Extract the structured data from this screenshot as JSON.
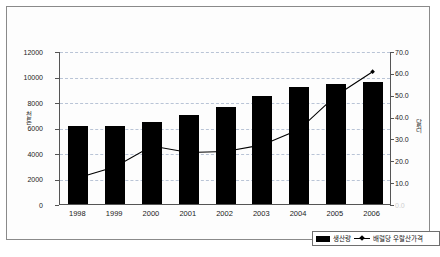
{
  "chart_data": {
    "type": "bar",
    "title": "",
    "subtitle": "",
    "xlabel": "",
    "categories": [
      "1998",
      "1999",
      "2000",
      "2001",
      "2002",
      "2003",
      "2004",
      "2005",
      "2006"
    ],
    "grid": true,
    "legend_position": "bottom-right",
    "series": [
      {
        "name": "생산량",
        "type": "bar",
        "axis": "left",
        "color": "#000000",
        "values": [
          6100,
          6100,
          6450,
          6950,
          7600,
          8450,
          9150,
          9450,
          9550
        ]
      },
      {
        "name": "배럴당 우랄산가격",
        "type": "line",
        "axis": "right",
        "color": "#000000",
        "marker": "diamond",
        "values": [
          12.5,
          17.5,
          27.0,
          24.0,
          24.5,
          27.5,
          34.5,
          50.0,
          61.0
        ]
      }
    ],
    "left_axis": {
      "label": "천톤",
      "min": 0,
      "max": 12000,
      "ticks": [
        0,
        2000,
        4000,
        6000,
        8000,
        10000,
        12000
      ],
      "tick_labels": [
        "0",
        "2000",
        "4000",
        "6000",
        "8000",
        "10000",
        "12000"
      ]
    },
    "right_axis": {
      "label": "달러",
      "min": 0,
      "max": 70,
      "ticks": [
        0,
        10,
        20,
        30,
        40,
        50,
        60,
        70
      ],
      "tick_labels": [
        "0.0",
        "10.0",
        "20.0",
        "30.0",
        "40.0",
        "50.0",
        "60.0",
        "70.0"
      ]
    }
  },
  "legend": {
    "bar_label": "생산량",
    "line_label": "배럴당 우랄산가격"
  },
  "caption": {
    "text": ""
  }
}
